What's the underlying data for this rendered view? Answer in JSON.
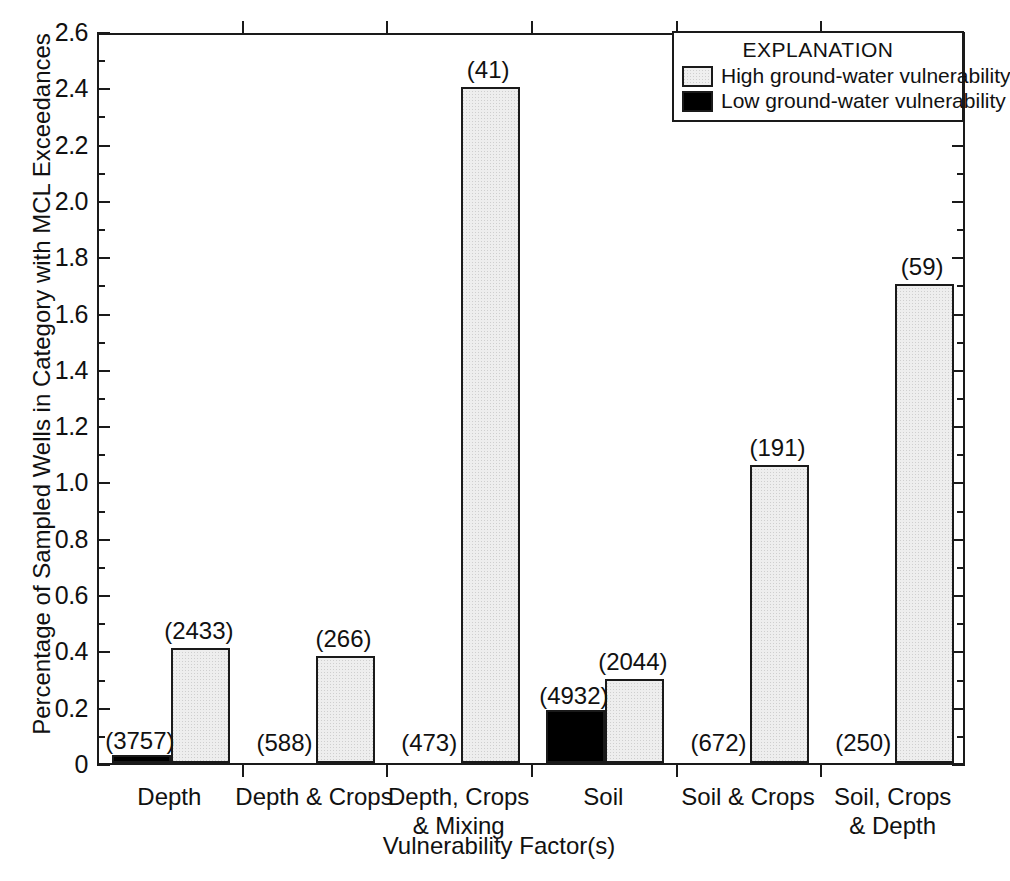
{
  "chart_data": {
    "type": "bar",
    "title": "",
    "xlabel": "Vulnerability Factor(s)",
    "ylabel": "Percentage of Sampled Wells in Category with  MCL Exceedances",
    "ylim": [
      0,
      2.6
    ],
    "ytick_step": 0.2,
    "yticks": [
      "0",
      "0.2",
      "0.4",
      "0.6",
      "0.8",
      "1.0",
      "1.2",
      "1.4",
      "1.6",
      "1.8",
      "2.0",
      "2.2",
      "2.4",
      "2.6"
    ],
    "grid": false,
    "legend_position": "top-right",
    "categories": [
      "Depth",
      "Depth & Crops",
      "Depth, Crops\n& Mixing",
      "Soil",
      "Soil & Crops",
      "Soil, Crops\n& Depth"
    ],
    "series": [
      {
        "name": "Low ground-water vulnerability",
        "color": "#000000",
        "values": [
          0.03,
          0.0,
          0.0,
          0.19,
          0.0,
          0.0
        ],
        "counts": [
          "(3757)",
          "(588)",
          "(473)",
          "(4932)",
          "(672)",
          "(250)"
        ]
      },
      {
        "name": "High ground-water vulnerability",
        "color": "#eeeeee",
        "values": [
          0.41,
          0.38,
          2.4,
          0.3,
          1.06,
          1.7
        ],
        "counts": [
          "(2433)",
          "(266)",
          "(41)",
          "(2044)",
          "(191)",
          "(59)"
        ]
      }
    ]
  },
  "legend": {
    "title": "EXPLANATION",
    "entries": [
      {
        "label": "High ground-water vulnerability",
        "swatch": "high"
      },
      {
        "label": "Low ground-water vulnerability",
        "swatch": "low"
      }
    ]
  }
}
